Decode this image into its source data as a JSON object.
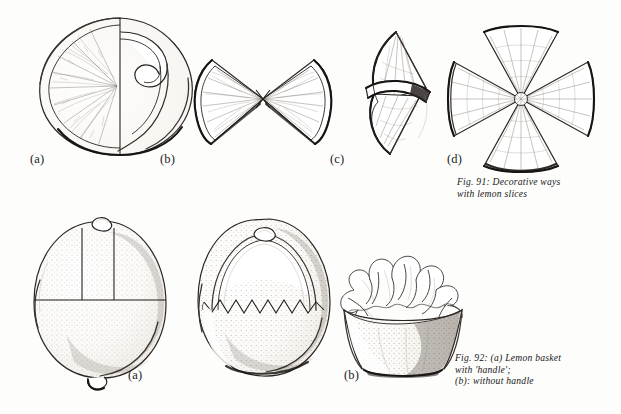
{
  "plate": {
    "title": "Decorative lemon garnishes plate",
    "background_color": "#fdfdfc",
    "ink_color": "#25211e",
    "medium": "pen-and-ink stipple line drawing"
  },
  "figures": [
    {
      "id": "fig-91",
      "caption_lines": [
        "Fig. 91: Decorative ways",
        "with lemon slices"
      ],
      "caption_full": "Fig. 91: Decorative ways with lemon slices",
      "items": [
        {
          "label": "(a)",
          "subject": "lemon slice with peel cut loose and curled inward",
          "description": "round lemon slice, left half showing radiating pulp segments, right half of rind detached and curled into a hook"
        },
        {
          "label": "(b)",
          "subject": "bow-tie of two lemon wedges",
          "description": "two half-slice wedges joined point to point forming a butterfly or bow shape"
        },
        {
          "label": "(c)",
          "subject": "two wedges interlocked and twisted",
          "description": "pair of lemon wedges slotted through one another and stood on end"
        },
        {
          "label": "(d)",
          "subject": "four wedges arranged as a cross",
          "description": "four fan-shaped lemon wedges set point to centre making a cross or flower"
        }
      ]
    },
    {
      "id": "fig-92",
      "caption_lines": [
        "Fig. 92: (a) Lemon basket",
        "with 'handle';",
        "(b): without handle"
      ],
      "caption_full": "Fig. 92: (a) Lemon basket with 'handle'; (b): without handle",
      "items": [
        {
          "label": "(a)",
          "subject": "whole lemon marked with cutting guide lines",
          "description": "whole lemon with two vertical cuts and a horizontal cut scored to free the handle"
        },
        {
          "label": "(b)",
          "subject": "finished lemon basket with handle",
          "description": "hollowed lemon with arched handle and zig-zag vandyked rim"
        },
        {
          "label": "(b)",
          "subject": "lemon basket without handle filled with salad garnish",
          "description": "cup-shaped hollowed lemon heaped with leafy garnish"
        }
      ]
    }
  ],
  "labels": {
    "top_a": "(a)",
    "top_b": "(b)",
    "top_c": "(c)",
    "top_d": "(d)",
    "bottom_a": "(a)",
    "bottom_b": "(b)"
  },
  "captions": {
    "fig91_line1": "Fig. 91: Decorative ways",
    "fig91_line2": "with lemon slices",
    "fig92_line1": "Fig. 92: (a) Lemon basket",
    "fig92_line2": "with 'handle';",
    "fig92_line3": "(b): without handle"
  }
}
